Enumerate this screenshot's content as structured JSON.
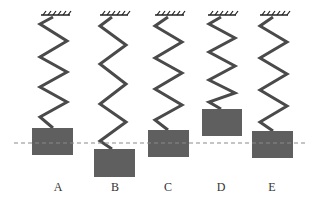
{
  "diagram": {
    "colors": {
      "spring": "#4a4a4a",
      "block": "#5f5f5f",
      "ceiling": "#222222",
      "dashed_line": "#8a8a8a",
      "label": "#333333"
    },
    "reference_line": {
      "y": 143,
      "x_start": 14,
      "x_end": 306,
      "style": "dashed"
    },
    "systems": [
      {
        "label": "A",
        "ceiling": {
          "x1": 41,
          "x2": 70,
          "y": 14
        },
        "spring_points": [
          [
            53,
            17
          ],
          [
            40,
            24
          ],
          [
            67,
            41
          ],
          [
            40,
            57
          ],
          [
            67,
            72
          ],
          [
            40,
            87
          ],
          [
            67,
            102
          ],
          [
            40,
            117
          ],
          [
            53,
            128
          ]
        ],
        "block": {
          "x": 32,
          "y": 128,
          "w": 41,
          "h": 27
        },
        "label_x": 48
      },
      {
        "label": "B",
        "ceiling": {
          "x1": 100,
          "x2": 128,
          "y": 14
        },
        "spring_points": [
          [
            112,
            17
          ],
          [
            100,
            26
          ],
          [
            126,
            45
          ],
          [
            100,
            64
          ],
          [
            126,
            84
          ],
          [
            100,
            104
          ],
          [
            126,
            122
          ],
          [
            100,
            141
          ],
          [
            112,
            149
          ]
        ],
        "block": {
          "x": 94,
          "y": 149,
          "w": 41,
          "h": 28
        },
        "label_x": 105
      },
      {
        "label": "C",
        "ceiling": {
          "x1": 155,
          "x2": 184,
          "y": 14
        },
        "spring_points": [
          [
            168,
            17
          ],
          [
            155,
            26
          ],
          [
            182,
            42
          ],
          [
            155,
            58
          ],
          [
            182,
            73
          ],
          [
            155,
            89
          ],
          [
            182,
            105
          ],
          [
            155,
            120
          ],
          [
            168,
            130
          ]
        ],
        "block": {
          "x": 148,
          "y": 130,
          "w": 41,
          "h": 27
        },
        "label_x": 158
      },
      {
        "label": "D",
        "ceiling": {
          "x1": 208,
          "x2": 236,
          "y": 14
        },
        "spring_points": [
          [
            221,
            17
          ],
          [
            209,
            24
          ],
          [
            235,
            38
          ],
          [
            209,
            52
          ],
          [
            235,
            66
          ],
          [
            209,
            80
          ],
          [
            235,
            93
          ],
          [
            209,
            102
          ],
          [
            221,
            109
          ]
        ],
        "block": {
          "x": 202,
          "y": 109,
          "w": 40,
          "h": 27
        },
        "label_x": 211
      },
      {
        "label": "E",
        "ceiling": {
          "x1": 260,
          "x2": 288,
          "y": 14
        },
        "spring_points": [
          [
            273,
            17
          ],
          [
            260,
            26
          ],
          [
            287,
            42
          ],
          [
            260,
            58
          ],
          [
            287,
            74
          ],
          [
            260,
            90
          ],
          [
            287,
            106
          ],
          [
            260,
            122
          ],
          [
            273,
            131
          ]
        ],
        "block": {
          "x": 252,
          "y": 131,
          "w": 41,
          "h": 27
        },
        "label_x": 262
      }
    ]
  },
  "labels": {
    "a": "A",
    "b": "B",
    "c": "C",
    "d": "D",
    "e": "E"
  }
}
